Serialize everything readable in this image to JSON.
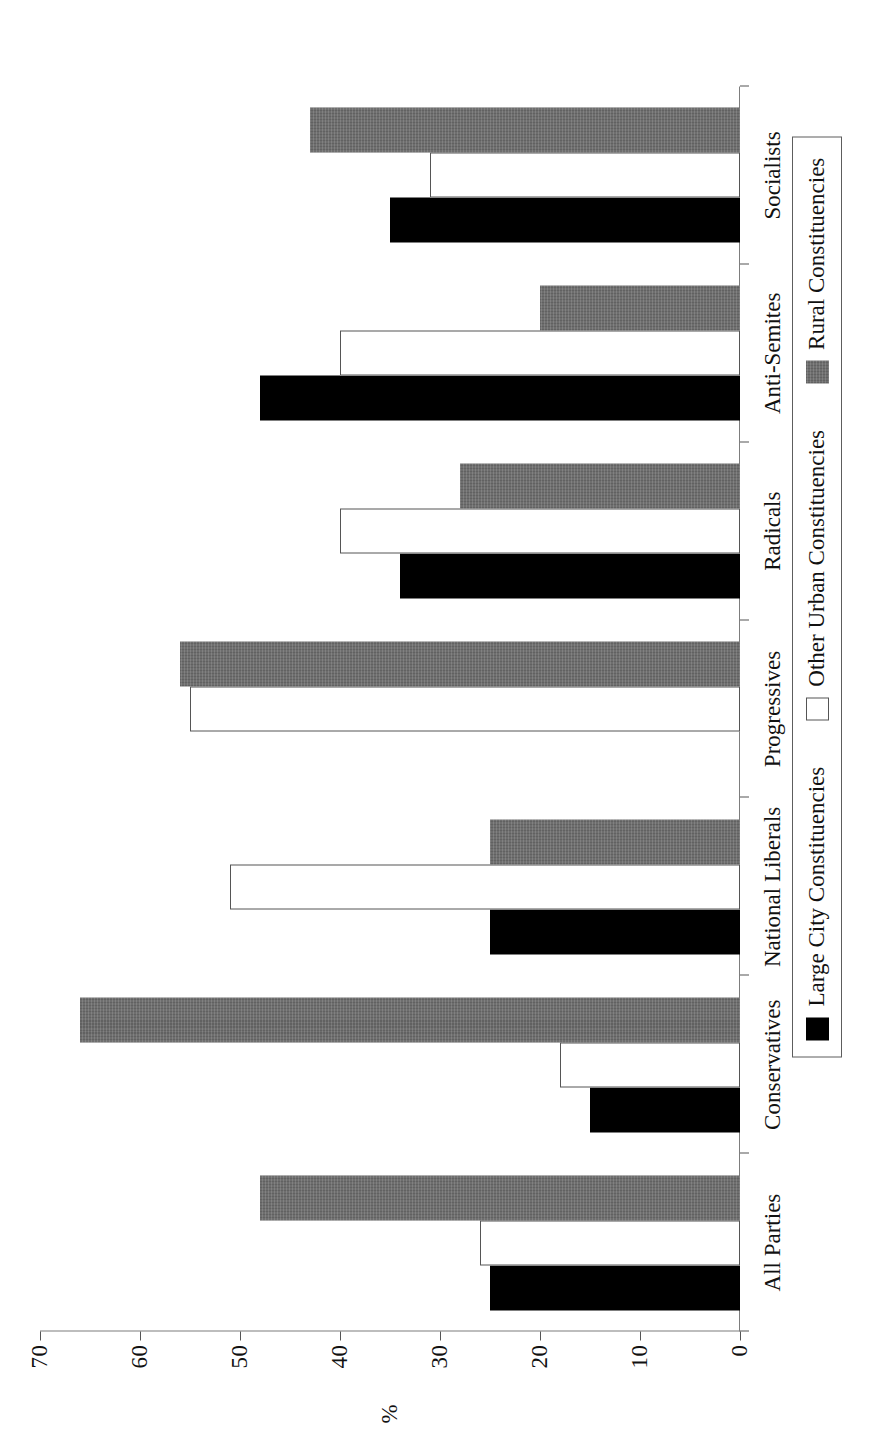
{
  "chart_data": {
    "type": "bar",
    "title": "",
    "xlabel": "",
    "ylabel": "%",
    "ylim": [
      0,
      70
    ],
    "yticks": [
      0,
      10,
      20,
      30,
      40,
      50,
      60,
      70
    ],
    "grid": false,
    "orientation": "vertical-bars-on-rotated-page",
    "legend_position": "bottom",
    "categories": [
      "All Parties",
      "Conservatives",
      "National Liberals",
      "Progressives",
      "Radicals",
      "Anti-Semites",
      "Socialists"
    ],
    "series": [
      {
        "name": "Large City Constituencies",
        "color": "#000000",
        "values": [
          25,
          15,
          25,
          0,
          34,
          48,
          35
        ]
      },
      {
        "name": "Other Urban Constituencies",
        "color": "#ffffff",
        "values": [
          26,
          18,
          51,
          55,
          40,
          40,
          31
        ]
      },
      {
        "name": "Rural Constituencies",
        "color": "#6e6e6e",
        "values": [
          48,
          66,
          25,
          56,
          28,
          20,
          43
        ]
      }
    ]
  },
  "legend": {
    "items": [
      {
        "label": "Large City Constituencies",
        "swatch": "black-square-icon"
      },
      {
        "label": "Other Urban Constituencies",
        "swatch": "white-square-icon"
      },
      {
        "label": "Rural Constituencies",
        "swatch": "gray-square-icon"
      }
    ]
  },
  "axes": {
    "value_axis_label": "%",
    "tick_labels": [
      "0",
      "10",
      "20",
      "30",
      "40",
      "50",
      "60",
      "70"
    ]
  }
}
